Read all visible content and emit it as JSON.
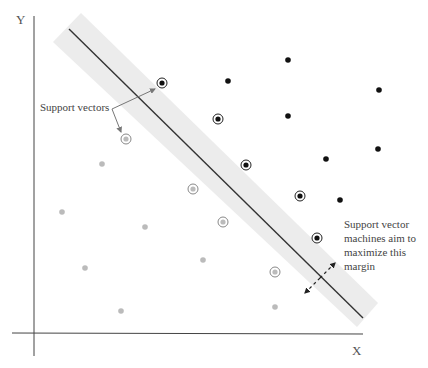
{
  "axes": {
    "x_label": "X",
    "y_label": "Y"
  },
  "annotations": {
    "support_vectors": "Support vectors",
    "margin_lines": [
      "Support vector",
      "machines aim to",
      "maximize this",
      "margin"
    ]
  },
  "colors": {
    "class_a": "#111111",
    "class_b": "#bbbbbb",
    "margin_band": "#ececec",
    "hyperplane": "#333333",
    "axis": "#444444",
    "arrow": "#777777"
  },
  "points": {
    "class_a_support": [
      [
        162,
        83
      ],
      [
        218,
        119
      ],
      [
        246,
        165
      ],
      [
        300,
        196
      ],
      [
        317,
        238
      ]
    ],
    "class_a": [
      [
        228,
        81
      ],
      [
        288,
        60
      ],
      [
        379,
        90
      ],
      [
        288,
        116
      ],
      [
        326,
        159
      ],
      [
        378,
        149
      ],
      [
        340,
        200
      ]
    ],
    "class_b_support": [
      [
        126,
        139
      ],
      [
        193,
        189
      ],
      [
        223,
        222
      ],
      [
        275,
        272
      ]
    ],
    "class_b": [
      [
        102,
        164
      ],
      [
        62,
        212
      ],
      [
        145,
        227
      ],
      [
        85,
        268
      ],
      [
        203,
        260
      ],
      [
        121,
        311
      ],
      [
        275,
        307
      ]
    ]
  },
  "hyperplane": {
    "x1": 69,
    "y1": 29,
    "x2": 363,
    "y2": 318
  },
  "margin_band": [
    [
      81,
      13
    ],
    [
      378,
      303
    ],
    [
      357,
      327
    ],
    [
      53,
      42
    ]
  ]
}
